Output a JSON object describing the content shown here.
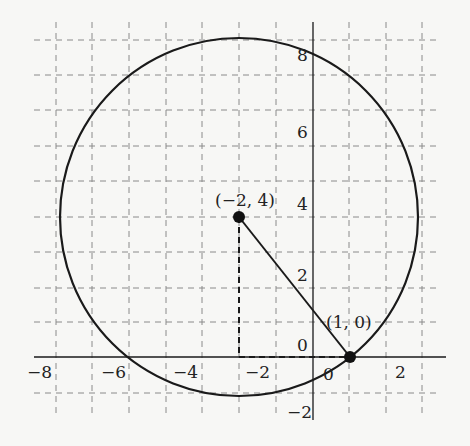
{
  "figure": {
    "type": "circle-on-coordinate-grid",
    "center": {
      "x": -2,
      "y": 4,
      "label": "(−2, 4)"
    },
    "point_on_circle": {
      "x": 1,
      "y": 0,
      "label": "(1, 0)"
    },
    "radius": 5,
    "x_tick_labels": [
      "−8",
      "−6",
      "−4",
      "−2",
      "0",
      "2"
    ],
    "y_tick_labels": [
      "8",
      "6",
      "4",
      "2",
      "0",
      "−2"
    ],
    "grid": "dashed, 1 unit spacing",
    "colors": {
      "ink": "#1a1a1a",
      "grid": "#8a8a8a",
      "background": "#f7f7f5"
    }
  }
}
